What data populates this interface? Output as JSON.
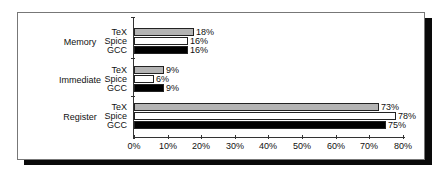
{
  "chart_data": {
    "type": "bar",
    "orientation": "horizontal",
    "title": "",
    "xlabel": "",
    "ylabel": "",
    "xlim": [
      0,
      80
    ],
    "x_ticks": [
      "0%",
      "10%",
      "20%",
      "30%",
      "40%",
      "50%",
      "60%",
      "70%",
      "80%"
    ],
    "grid": false,
    "legend": "none (series labels shown next to bars)",
    "categories": [
      "Memory",
      "Immediate",
      "Register"
    ],
    "series": [
      {
        "name": "TeX",
        "color": "#b4b4b4",
        "values": [
          18,
          9,
          73
        ]
      },
      {
        "name": "Spice",
        "color": "#ffffff",
        "values": [
          16,
          6,
          78
        ]
      },
      {
        "name": "GCC",
        "color": "#000000",
        "values": [
          16,
          9,
          75
        ]
      }
    ],
    "value_labels": {
      "Memory": [
        "18%",
        "16%",
        "16%"
      ],
      "Immediate": [
        "9%",
        "6%",
        "9%"
      ],
      "Register": [
        "73%",
        "78%",
        "75%"
      ]
    }
  },
  "groups": [
    {
      "label": "Memory",
      "series": [
        "TeX",
        "Spice",
        "GCC"
      ]
    },
    {
      "label": "Immediate",
      "series": [
        "TeX",
        "Spice",
        "GCC"
      ]
    },
    {
      "label": "Register",
      "series": [
        "TeX",
        "Spice",
        "GCC"
      ]
    }
  ]
}
